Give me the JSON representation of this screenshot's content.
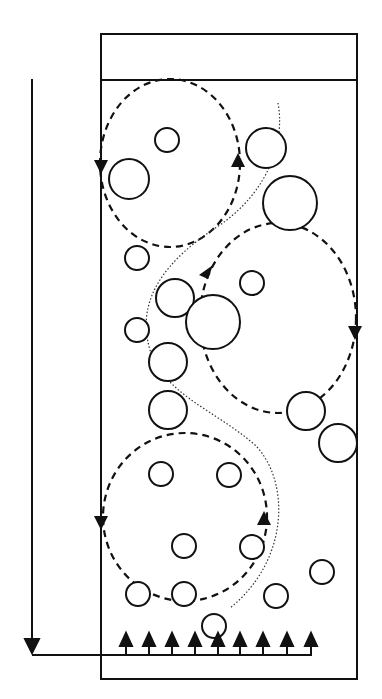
{
  "diagram": {
    "title": "",
    "type": "bubble-column-circulation-schematic",
    "colors": {
      "stroke": "#111111",
      "background": "#ffffff"
    },
    "column": {
      "x": 101,
      "y": 34,
      "width": 256,
      "height": 645,
      "header_line_y": 80
    },
    "external_loop": {
      "x": 32,
      "top_y": 79,
      "bottom_y": 652,
      "arrow": "down"
    },
    "sparger": {
      "y": 655,
      "x_start": 32,
      "x_end": 312,
      "arrow_xs": [
        126,
        149,
        172,
        195,
        218,
        240,
        263,
        287,
        311
      ]
    },
    "circulation_cells": [
      {
        "name": "upper-left-cell",
        "cx": 170,
        "cy": 163,
        "rx": 70,
        "ry": 84,
        "direction": "counterclockwise"
      },
      {
        "name": "middle-right-cell",
        "cx": 278,
        "cy": 318,
        "rx": 78,
        "ry": 95,
        "direction": "clockwise"
      },
      {
        "name": "lower-left-cell",
        "cx": 185,
        "cy": 517,
        "rx": 82,
        "ry": 84,
        "direction": "counterclockwise"
      }
    ],
    "bubbles": [
      {
        "cx": 167,
        "cy": 140,
        "r": 12
      },
      {
        "cx": 129,
        "cy": 179,
        "r": 20
      },
      {
        "cx": 266,
        "cy": 148,
        "r": 20
      },
      {
        "cx": 290,
        "cy": 203,
        "r": 27
      },
      {
        "cx": 137,
        "cy": 258,
        "r": 12
      },
      {
        "cx": 252,
        "cy": 283,
        "r": 12
      },
      {
        "cx": 175,
        "cy": 298,
        "r": 19
      },
      {
        "cx": 213,
        "cy": 322,
        "r": 27
      },
      {
        "cx": 137,
        "cy": 330,
        "r": 12
      },
      {
        "cx": 168,
        "cy": 362,
        "r": 19
      },
      {
        "cx": 168,
        "cy": 410,
        "r": 19
      },
      {
        "cx": 306,
        "cy": 411,
        "r": 19
      },
      {
        "cx": 338,
        "cy": 443,
        "r": 19
      },
      {
        "cx": 161,
        "cy": 474,
        "r": 12
      },
      {
        "cx": 229,
        "cy": 475,
        "r": 12
      },
      {
        "cx": 184,
        "cy": 546,
        "r": 12
      },
      {
        "cx": 252,
        "cy": 547,
        "r": 12
      },
      {
        "cx": 322,
        "cy": 572,
        "r": 12
      },
      {
        "cx": 138,
        "cy": 594,
        "r": 12
      },
      {
        "cx": 184,
        "cy": 594,
        "r": 12
      },
      {
        "cx": 276,
        "cy": 596,
        "r": 12
      },
      {
        "cx": 214,
        "cy": 626,
        "r": 12
      }
    ]
  }
}
